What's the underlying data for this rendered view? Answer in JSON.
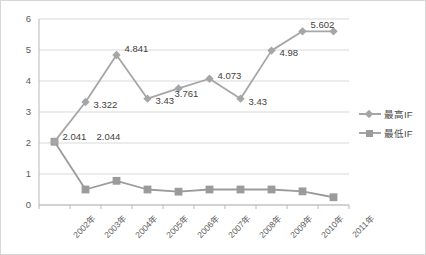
{
  "chart_data": {
    "type": "line",
    "title": "",
    "subtitle": "",
    "xlabel": "",
    "ylabel": "",
    "ylim": [
      0,
      6
    ],
    "yticks": [
      "0",
      "1",
      "2",
      "3",
      "4",
      "5",
      "6"
    ],
    "grid": true,
    "legend_position": "right",
    "categories": [
      "2002年",
      "2003年",
      "2004年",
      "2005年",
      "2006年",
      "2007年",
      "2008年",
      "2009年",
      "2010年",
      "2011年"
    ],
    "series": [
      {
        "name": "最高IF",
        "marker": "diamond",
        "color": "#a6a6a6",
        "values": [
          2.044,
          3.322,
          4.841,
          3.43,
          3.761,
          4.073,
          3.43,
          4.98,
          5.602,
          5.602
        ],
        "point_labels": [
          "2.044",
          "3.322",
          "4.841",
          "3.43",
          "3.761",
          "4.073",
          "3.43",
          "4.98",
          "5.602",
          ""
        ]
      },
      {
        "name": "最低IF",
        "marker": "square",
        "color": "#9b9b9b",
        "values": [
          2.041,
          0.5,
          0.78,
          0.5,
          0.43,
          0.5,
          0.5,
          0.5,
          0.44,
          0.25
        ],
        "point_labels": [
          "2.041",
          "",
          "",
          "",
          "",
          "",
          "",
          "",
          "",
          ""
        ]
      }
    ],
    "annotations": [
      {
        "text": "2.041",
        "series": "最低IF",
        "category": "2002年"
      },
      {
        "text": "2.044",
        "series": "最高IF",
        "category": "2002年"
      },
      {
        "text": "3.322",
        "series": "最高IF",
        "category": "2003年"
      },
      {
        "text": "4.841",
        "series": "最高IF",
        "category": "2004年"
      },
      {
        "text": "3.43",
        "series": "最高IF",
        "category": "2005年"
      },
      {
        "text": "3.761",
        "series": "最高IF",
        "category": "2006年"
      },
      {
        "text": "4.073",
        "series": "最高IF",
        "category": "2007年"
      },
      {
        "text": "3.43",
        "series": "最高IF",
        "category": "2008年"
      },
      {
        "text": "4.98",
        "series": "最高IF",
        "category": "2009年"
      },
      {
        "text": "5.602",
        "series": "最高IF",
        "category": "2010年"
      }
    ]
  },
  "axis": {
    "y_ticks": [
      {
        "label": "6"
      },
      {
        "label": "5"
      },
      {
        "label": "4"
      },
      {
        "label": "3"
      },
      {
        "label": "2"
      },
      {
        "label": "1"
      },
      {
        "label": "0"
      }
    ],
    "x_ticks": [
      {
        "label": "2002年"
      },
      {
        "label": "2003年"
      },
      {
        "label": "2004年"
      },
      {
        "label": "2005年"
      },
      {
        "label": "2006年"
      },
      {
        "label": "2007年"
      },
      {
        "label": "2008年"
      },
      {
        "label": "2009年"
      },
      {
        "label": "2010年"
      },
      {
        "label": "2011年"
      }
    ]
  },
  "data_labels": [
    {
      "text": "2.041"
    },
    {
      "text": "2.044"
    },
    {
      "text": "3.322"
    },
    {
      "text": "4.841"
    },
    {
      "text": "3.43"
    },
    {
      "text": "3.761"
    },
    {
      "text": "4.073"
    },
    {
      "text": "3.43"
    },
    {
      "text": "4.98"
    },
    {
      "text": "5.602"
    }
  ],
  "legend": {
    "items": [
      {
        "label": "最高IF"
      },
      {
        "label": "最低IF"
      }
    ]
  },
  "colors": {
    "series_high": "#a6a6a6",
    "series_low": "#9b9b9b",
    "grid": "#d9d9d9",
    "axis": "#b7b7b7",
    "text": "#5a5a5a",
    "border": "#d6d6d6",
    "background": "#ffffff"
  }
}
